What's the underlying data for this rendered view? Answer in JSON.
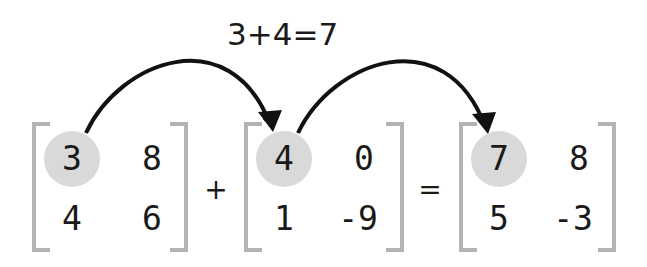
{
  "caption": "3+4=7",
  "operators": {
    "plus": "+",
    "equals": "="
  },
  "matrices": [
    {
      "name": "A",
      "cells": [
        [
          "3",
          "8"
        ],
        [
          "4",
          "6"
        ]
      ],
      "highlight": [
        0,
        0
      ]
    },
    {
      "name": "B",
      "cells": [
        [
          "4",
          "0"
        ],
        [
          "1",
          "-9"
        ]
      ],
      "highlight": [
        0,
        0
      ]
    },
    {
      "name": "C",
      "cells": [
        [
          "7",
          "8"
        ],
        [
          "5",
          "-3"
        ]
      ],
      "highlight": [
        0,
        0
      ]
    }
  ],
  "colors": {
    "bracket": "#b3b3b3",
    "highlight": "#d9d9d9",
    "arrow": "#111111",
    "text": "#1a1a1a"
  },
  "arrows": [
    {
      "from": "A[0][0]",
      "to": "B[0][0]"
    },
    {
      "from": "B[0][0]",
      "to": "C[0][0]"
    }
  ]
}
